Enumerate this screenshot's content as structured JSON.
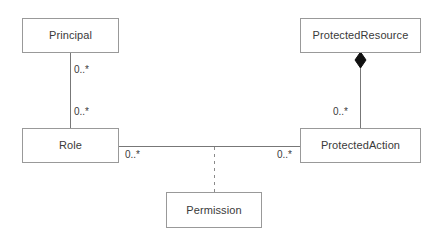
{
  "diagram": {
    "type": "uml-class-diagram",
    "canvas": {
      "width": 442,
      "height": 239,
      "background": "#ffffff"
    },
    "style": {
      "box_border_color": "#999999",
      "box_fill_color": "#ffffff",
      "text_color": "#3a3a3a",
      "line_color": "#777777",
      "diamond_fill_color": "#111111"
    },
    "classes": [
      {
        "id": "principal",
        "name": "Principal"
      },
      {
        "id": "protected_resource",
        "name": "ProtectedResource"
      },
      {
        "id": "role",
        "name": "Role"
      },
      {
        "id": "protected_action",
        "name": "ProtectedAction"
      },
      {
        "id": "permission",
        "name": "Permission"
      }
    ],
    "associations": [
      {
        "id": "principal-role",
        "from": "Principal",
        "to": "Role",
        "kind": "association",
        "line_style": "solid",
        "source_multiplicity": "0..*",
        "target_multiplicity": "0..*"
      },
      {
        "id": "role-protected-action",
        "from": "Role",
        "to": "ProtectedAction",
        "kind": "association",
        "line_style": "solid",
        "source_multiplicity": "0..*",
        "target_multiplicity": "0..*"
      },
      {
        "id": "protected-resource-protected-action",
        "from": "ProtectedResource",
        "to": "ProtectedAction",
        "kind": "composition",
        "line_style": "solid",
        "source_decoration": "filled-diamond",
        "source_multiplicity": "",
        "target_multiplicity": "0..*"
      },
      {
        "id": "permission-association-class",
        "from": "Permission",
        "to": "role-protected-action",
        "kind": "association-class-link",
        "line_style": "dashed"
      }
    ],
    "multiplicity_labels": {
      "principal_to_role_top": "0..*",
      "principal_to_role_bottom": "0..*",
      "role_to_action_left": "0..*",
      "role_to_action_right": "0..*",
      "resource_to_action": "0..*"
    }
  }
}
